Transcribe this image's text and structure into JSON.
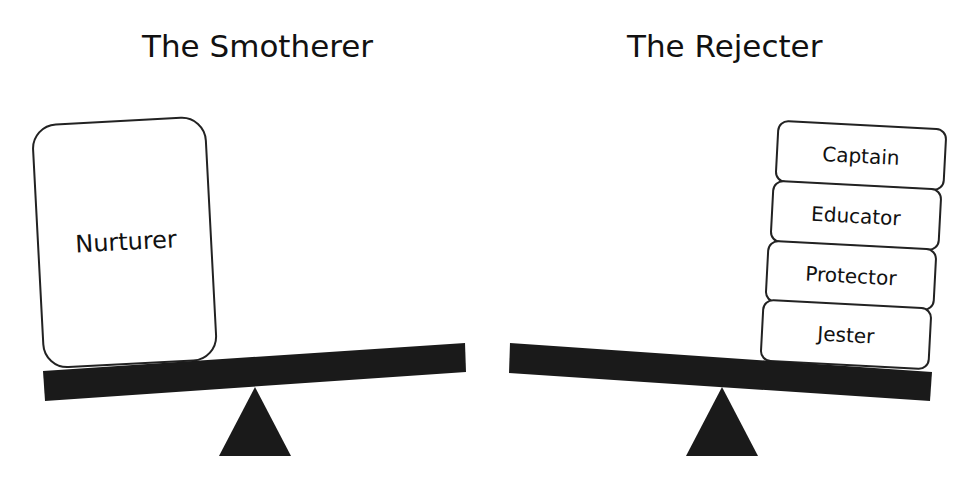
{
  "left_panel": {
    "title": "The Smotherer",
    "weights": [
      {
        "label": "Nurturer"
      }
    ],
    "tilt": "left side down"
  },
  "right_panel": {
    "title": "The Rejecter",
    "weights": [
      {
        "label": "Captain"
      },
      {
        "label": "Educator"
      },
      {
        "label": "Protector"
      },
      {
        "label": "Jester"
      }
    ],
    "tilt": "right side down"
  },
  "colors": {
    "beam": "#1a1a1a",
    "fulcrum": "#1a1a1a",
    "box_stroke": "#222222",
    "box_fill": "#ffffff",
    "background": "#ffffff"
  }
}
